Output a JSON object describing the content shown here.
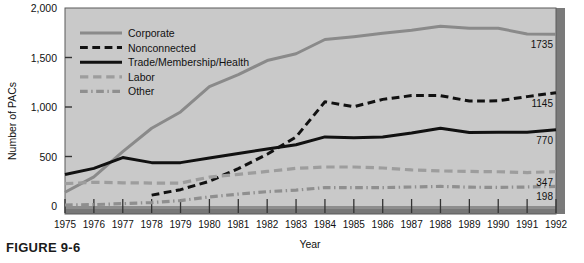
{
  "figure": {
    "caption": "FIGURE 9-6"
  },
  "chart_data": {
    "type": "line",
    "title": "",
    "xlabel": "Year",
    "ylabel": "Number of PACs",
    "x": [
      1975,
      1976,
      1977,
      1978,
      1979,
      1980,
      1981,
      1982,
      1983,
      1984,
      1985,
      1986,
      1987,
      1988,
      1989,
      1990,
      1991,
      1992
    ],
    "xtick_labels": [
      "1975",
      "1976",
      "1977",
      "1978",
      "1979",
      "1980",
      "1981",
      "1982",
      "1983",
      "1984",
      "1985",
      "1986",
      "1987",
      "1988",
      "1989",
      "1990",
      "1991",
      "1992"
    ],
    "ytick_labels": [
      "0",
      "500",
      "1,000",
      "1,500",
      "2,000"
    ],
    "ytick_values": [
      0,
      500,
      1000,
      1500,
      2000
    ],
    "ylim": [
      0,
      2000
    ],
    "xlim": [
      1975,
      1992
    ],
    "grid": false,
    "legend_position": "upper-left-inside",
    "plot_background": "#c9c9c9",
    "series": [
      {
        "name": "Corporate",
        "style": "solid",
        "color": "#8a8a8a",
        "width": 3,
        "end_label": "1735",
        "values": [
          139,
          294,
          550,
          785,
          950,
          1206,
          1327,
          1469,
          1538,
          1682,
          1710,
          1744,
          1775,
          1816,
          1796,
          1795,
          1738,
          1735
        ]
      },
      {
        "name": "Nonconnected",
        "style": "dashed",
        "color": "#111111",
        "width": 3,
        "end_label": "1145",
        "values": [
          null,
          null,
          null,
          110,
          165,
          250,
          378,
          523,
          697,
          1053,
          1003,
          1077,
          1115,
          1115,
          1060,
          1062,
          1105,
          1145
        ]
      },
      {
        "name": "Trade/Membership/Health",
        "style": "solid",
        "color": "#111111",
        "width": 3,
        "end_label": "770",
        "values": [
          318,
          380,
          489,
          438,
          438,
          484,
          530,
          575,
          618,
          698,
          690,
          698,
          738,
          786,
          742,
          744,
          745,
          770
        ]
      },
      {
        "name": "Labor",
        "style": "dashed",
        "color": "#9d9d9d",
        "width": 3.2,
        "end_label": "347",
        "values": [
          226,
          240,
          234,
          232,
          231,
          292,
          319,
          349,
          380,
          394,
          394,
          384,
          364,
          354,
          349,
          346,
          338,
          347
        ]
      },
      {
        "name": "Other",
        "style": "dashdot",
        "color": "#8f8f8f",
        "width": 3.2,
        "end_label": "198",
        "values": [
          10,
          14,
          24,
          35,
          55,
          92,
          120,
          145,
          160,
          186,
          186,
          186,
          192,
          198,
          190,
          188,
          192,
          198
        ]
      }
    ]
  }
}
